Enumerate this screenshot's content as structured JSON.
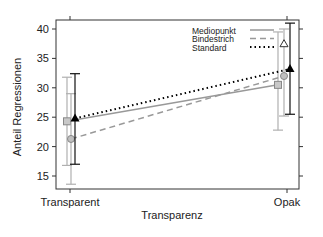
{
  "chart_data": {
    "type": "line",
    "title": "",
    "xlabel": "Transparenz",
    "ylabel": "Anteil Regressionen",
    "categories": [
      "Transparent",
      "Opak"
    ],
    "ylim": [
      13,
      41.5
    ],
    "yticks": [
      15,
      20,
      25,
      30,
      35,
      40
    ],
    "grid": false,
    "legend_position": "top-right",
    "series": [
      {
        "name": "Mediopunkt",
        "style": "solid",
        "marker": "square",
        "color": "#9a9a9a",
        "values": [
          24.3,
          30.5
        ],
        "err_low": [
          16.8,
          22.8
        ],
        "err_high": [
          31.8,
          39.5
        ]
      },
      {
        "name": "Bindestrich",
        "style": "dashed",
        "marker": "circle",
        "color": "#8a8a8a",
        "values": [
          21.3,
          32.0
        ],
        "err_low": [
          13.6,
          25.2
        ],
        "err_high": [
          29.0,
          40.0
        ]
      },
      {
        "name": "Standard",
        "style": "dotted",
        "marker": "triangle",
        "color": "#000000",
        "values": [
          24.8,
          33.2
        ],
        "err_low": [
          17.0,
          25.5
        ],
        "err_high": [
          32.4,
          41.0
        ]
      }
    ],
    "annotations": [
      {
        "type": "open-triangle",
        "x": "Opak",
        "y": 37.5
      }
    ]
  }
}
